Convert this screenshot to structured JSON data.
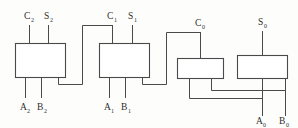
{
  "diagram": {
    "stroke_color": "#4a4a4a",
    "box_fill": "#ffffff",
    "background": "#fdfdfb",
    "blocks": [
      {
        "id": "adder-stage-2",
        "label": ""
      },
      {
        "id": "adder-stage-1",
        "label": ""
      },
      {
        "id": "adder-stage-0-carry",
        "label": ""
      },
      {
        "id": "adder-stage-0-sum",
        "label": ""
      }
    ],
    "labels": {
      "c2": {
        "base": "C",
        "sub": "2"
      },
      "s2": {
        "base": "S",
        "sub": "2"
      },
      "a2": {
        "base": "A",
        "sub": "2"
      },
      "b2": {
        "base": "B",
        "sub": "2"
      },
      "c1": {
        "base": "C",
        "sub": "1"
      },
      "s1": {
        "base": "S",
        "sub": "1"
      },
      "a1": {
        "base": "A",
        "sub": "1"
      },
      "b1": {
        "base": "B",
        "sub": "1"
      },
      "c0": {
        "base": "C",
        "sub": "0"
      },
      "s0": {
        "base": "S",
        "sub": "0"
      },
      "a0": {
        "base": "A",
        "sub": "0"
      },
      "b0": {
        "base": "B",
        "sub": "0"
      }
    }
  }
}
